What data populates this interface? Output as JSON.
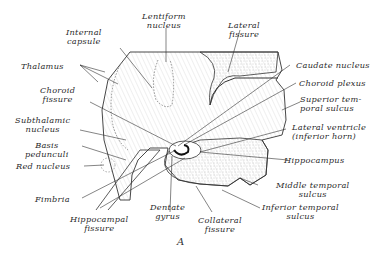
{
  "figure": {
    "caption": "A",
    "labels": {
      "internal_capsule": [
        "Internal",
        "capsule"
      ],
      "lentiform_nucleus": [
        "Lentiform",
        "nucleus"
      ],
      "lateral_fissure": [
        "Lateral",
        "fissure"
      ],
      "thalamus": "Thalamus",
      "caudate_nucleus": "Caudate nucleus",
      "choroid_fissure": [
        "Choroid",
        "fissure"
      ],
      "choroid_plexus": "Choroid plexus",
      "superior_temporal_sulcus": [
        "Superior tem-",
        "poral sulcus"
      ],
      "subthalamic_nucleus": [
        "Subthalamic",
        "nucleus"
      ],
      "lateral_ventricle": [
        "Lateral ventricle",
        "(inferior horn)"
      ],
      "basis_pedunculi": [
        "Basis",
        "pedunculi"
      ],
      "red_nucleus": "Red nucleus",
      "hippocampus": "Hippocampus",
      "middle_temporal_sulcus": [
        "Middle temporal",
        "sulcus"
      ],
      "fimbria": "Fimbria",
      "dentate_gyrus": [
        "Dentate",
        "gyrus"
      ],
      "inferior_temporal_sulcus": [
        "Inferior temporal",
        "sulcus"
      ],
      "hippocampal_fissure": [
        "Hippocampal",
        "fissure"
      ],
      "collateral_fissure": [
        "Collateral",
        "fissure"
      ]
    },
    "colors": {
      "ink": "#2a2a2a",
      "stipple": "#bdbdbd",
      "background": "#ffffff"
    }
  }
}
